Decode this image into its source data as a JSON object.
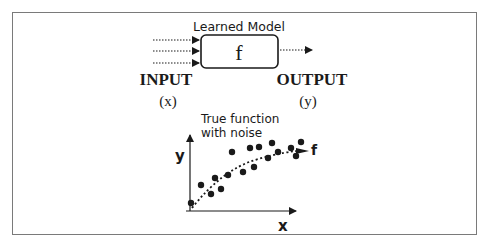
{
  "diagram": {
    "model_label": "Learned Model",
    "function_symbol": "f",
    "input_label": "INPUT",
    "input_var": "(x)",
    "output_label": "OUTPUT",
    "output_var": "(y)",
    "input_arrow_count": 3,
    "output_arrow_count": 1
  },
  "plot": {
    "title_line1": "True function",
    "title_line2": "with noise",
    "xlabel": "x",
    "ylabel": "y",
    "curve_label": "f",
    "points": [
      [
        191,
        203
      ],
      [
        201,
        185
      ],
      [
        211,
        194
      ],
      [
        215,
        178
      ],
      [
        221,
        189
      ],
      [
        228,
        175
      ],
      [
        232,
        152
      ],
      [
        243,
        172
      ],
      [
        250,
        148
      ],
      [
        254,
        167
      ],
      [
        259,
        147
      ],
      [
        268,
        158
      ],
      [
        272,
        143
      ],
      [
        278,
        152
      ],
      [
        291,
        148
      ],
      [
        296,
        156
      ],
      [
        301,
        142
      ]
    ],
    "curve_path": "M188,208 Q225,170 260,158 T305,150"
  },
  "colors": {
    "frame": "#7a7a7a",
    "ink": "#1a1a1a"
  }
}
